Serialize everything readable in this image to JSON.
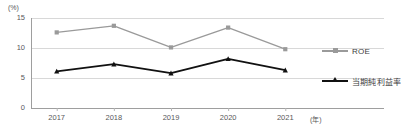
{
  "chart_data": {
    "type": "line",
    "title": "",
    "xlabel": "(年)",
    "ylabel": "(%)",
    "categories": [
      "2017",
      "2018",
      "2019",
      "2020",
      "2021"
    ],
    "ylim": [
      0,
      15
    ],
    "yticks": [
      "0",
      "5",
      "10",
      "15"
    ],
    "ytick_values": [
      0,
      5,
      10,
      15
    ],
    "grid": true,
    "legend_position": "right",
    "series": [
      {
        "name": "ROE",
        "color": "#9a9a9a",
        "marker": "square",
        "values": [
          12.6,
          13.7,
          10.1,
          13.4,
          9.8
        ]
      },
      {
        "name": "当期純利益率",
        "color": "#111111",
        "marker": "triangle",
        "values": [
          6.1,
          7.3,
          5.8,
          8.2,
          6.3
        ]
      }
    ]
  },
  "axes": {
    "y_unit": "(%)",
    "x_unit": "(年)"
  },
  "legend": {
    "items": [
      {
        "label": "ROE",
        "icon": "line-square-marker-icon"
      },
      {
        "label": "当期純利益率",
        "icon": "line-triangle-marker-icon"
      }
    ]
  }
}
